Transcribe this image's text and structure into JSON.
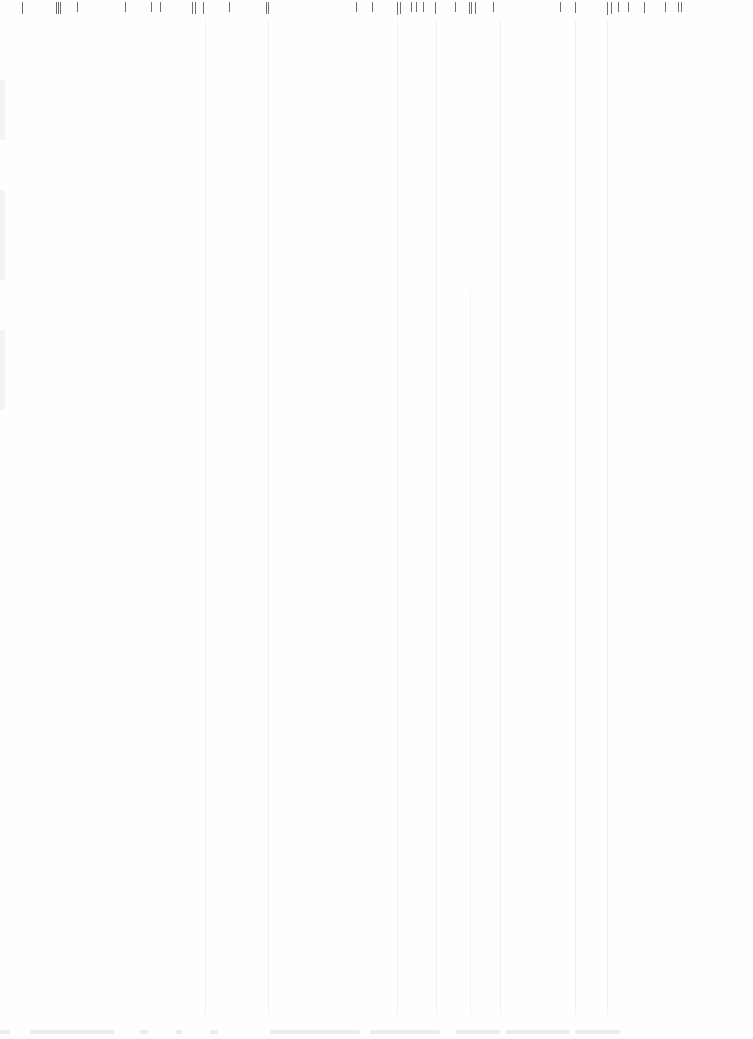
{
  "page": {
    "background": "#fefefe",
    "legible_text": []
  },
  "top_ticks": {
    "color": "#6f6f6f",
    "items": [
      {
        "x": 22,
        "h": 12
      },
      {
        "x": 56,
        "h": 12
      },
      {
        "x": 58,
        "h": 12
      },
      {
        "x": 60,
        "h": 12
      },
      {
        "x": 77,
        "h": 10
      },
      {
        "x": 125,
        "h": 10
      },
      {
        "x": 151,
        "h": 10
      },
      {
        "x": 160,
        "h": 10
      },
      {
        "x": 192,
        "h": 12
      },
      {
        "x": 195,
        "h": 12
      },
      {
        "x": 203,
        "h": 12
      },
      {
        "x": 229,
        "h": 10
      },
      {
        "x": 266,
        "h": 12
      },
      {
        "x": 268,
        "h": 12
      },
      {
        "x": 356,
        "h": 10
      },
      {
        "x": 372,
        "h": 10
      },
      {
        "x": 397,
        "h": 13
      },
      {
        "x": 400,
        "h": 12
      },
      {
        "x": 411,
        "h": 10
      },
      {
        "x": 416,
        "h": 10
      },
      {
        "x": 423,
        "h": 10
      },
      {
        "x": 435,
        "h": 12
      },
      {
        "x": 455,
        "h": 10
      },
      {
        "x": 469,
        "h": 12
      },
      {
        "x": 471,
        "h": 12
      },
      {
        "x": 475,
        "h": 12
      },
      {
        "x": 493,
        "h": 10
      },
      {
        "x": 560,
        "h": 10
      },
      {
        "x": 575,
        "h": 11
      },
      {
        "x": 607,
        "h": 13
      },
      {
        "x": 611,
        "h": 12
      },
      {
        "x": 618,
        "h": 10
      },
      {
        "x": 628,
        "h": 10
      },
      {
        "x": 644,
        "h": 11
      },
      {
        "x": 665,
        "h": 10
      },
      {
        "x": 678,
        "h": 10
      },
      {
        "x": 681,
        "h": 10
      }
    ]
  },
  "column_lines": {
    "color": "#f1f1f1",
    "items": [
      {
        "x": 205,
        "top": 20,
        "bottom": 1015
      },
      {
        "x": 268,
        "top": 20,
        "bottom": 1015
      },
      {
        "x": 397,
        "top": 20,
        "bottom": 1015
      },
      {
        "x": 436,
        "top": 20,
        "bottom": 1015
      },
      {
        "x": 470,
        "top": 290,
        "bottom": 1015
      },
      {
        "x": 500,
        "top": 20,
        "bottom": 1015
      },
      {
        "x": 575,
        "top": 20,
        "bottom": 1015
      },
      {
        "x": 607,
        "top": 20,
        "bottom": 1015
      }
    ]
  },
  "bottom_band": {
    "color": "#ececec",
    "marks": [
      {
        "x": 0,
        "w": 10
      },
      {
        "x": 30,
        "w": 85
      },
      {
        "x": 140,
        "w": 8
      },
      {
        "x": 175,
        "w": 8
      },
      {
        "x": 210,
        "w": 8
      },
      {
        "x": 270,
        "w": 90
      },
      {
        "x": 370,
        "w": 70
      },
      {
        "x": 455,
        "w": 45
      },
      {
        "x": 505,
        "w": 65
      },
      {
        "x": 575,
        "w": 45
      },
      {
        "x": 605,
        "w": 6
      }
    ]
  }
}
